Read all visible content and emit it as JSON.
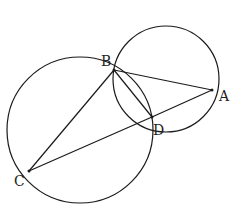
{
  "diagram": {
    "type": "geometry",
    "points": {
      "A": {
        "label": "A",
        "x": 212,
        "y": 90,
        "label_x": 219,
        "label_y": 101
      },
      "B": {
        "label": "B",
        "x": 114,
        "y": 70,
        "label_x": 101,
        "label_y": 66
      },
      "C": {
        "label": "C",
        "x": 29,
        "y": 171,
        "label_x": 14,
        "label_y": 186
      },
      "D": {
        "label": "D",
        "x": 152,
        "y": 117,
        "label_x": 153,
        "label_y": 135
      }
    },
    "circles": [
      {
        "name": "circle-ABD",
        "cx": 166,
        "cy": 79,
        "r": 53
      },
      {
        "name": "circle-BCD",
        "cx": 80,
        "cy": 130,
        "r": 73
      }
    ],
    "segments": [
      "BA",
      "AD",
      "DC",
      "CB",
      "BD"
    ],
    "colors": {
      "stroke": "#1a1a1a",
      "background": "#ffffff"
    }
  }
}
